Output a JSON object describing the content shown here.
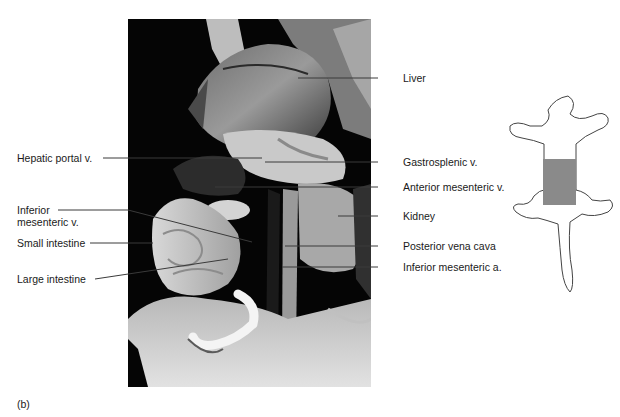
{
  "figure": {
    "caption": "(b)",
    "photo_alt": "Dissected rat abdominal cavity, grayscale photograph",
    "colors": {
      "background": "#ffffff",
      "photo_background": "#050505",
      "leader_line": "#3a3a3a",
      "label_text": "#1a1a1a",
      "rat_outline": "#444444",
      "region_highlight": "#8a8a8a"
    }
  },
  "labels_left": [
    {
      "id": "hepatic-portal-v",
      "text": "Hepatic portal v."
    },
    {
      "id": "inferior-mesenteric-v",
      "line1": "Inferior",
      "line2": "mesenteric v."
    },
    {
      "id": "small-intestine",
      "text": "Small intestine"
    },
    {
      "id": "large-intestine",
      "text": "Large intestine"
    }
  ],
  "labels_right": [
    {
      "id": "liver",
      "text": "Liver"
    },
    {
      "id": "gastrosplenic-v",
      "text": "Gastrosplenic v."
    },
    {
      "id": "anterior-mesenteric-v",
      "text": "Anterior mesenteric v."
    },
    {
      "id": "kidney",
      "text": "Kidney"
    },
    {
      "id": "posterior-vena-cava",
      "text": "Posterior vena cava"
    },
    {
      "id": "inferior-mesenteric-a",
      "text": "Inferior mesenteric a."
    }
  ],
  "orientation_icon": {
    "name": "rat-silhouette",
    "highlighted_region": "abdomen"
  }
}
